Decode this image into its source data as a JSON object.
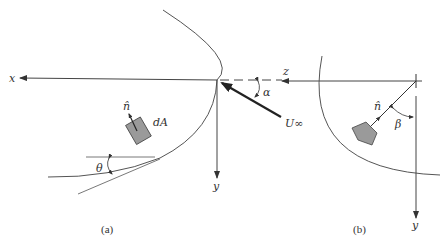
{
  "figure": {
    "panel_a": {
      "caption": "(a)",
      "axis_x_label": "x",
      "axis_y_label": "y",
      "element_label": "dA",
      "normal_label": "n̂",
      "angle_theta_label": "θ",
      "angle_alpha_label": "α",
      "freestream_label": "U∞"
    },
    "panel_b": {
      "caption": "(b)",
      "axis_z_label": "z",
      "axis_y_label": "y",
      "normal_label": "n̂",
      "angle_beta_label": "β"
    },
    "colors": {
      "line": "#555555",
      "bold_arrow": "#222222",
      "element_fill": "#9a9a9a"
    }
  }
}
